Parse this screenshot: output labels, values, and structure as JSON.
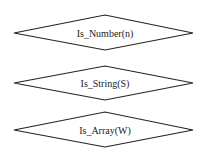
{
  "diagram": {
    "type": "flowchart-decisions",
    "stroke_color": "#222222",
    "background": "#ffffff",
    "nodes": [
      {
        "shape": "diamond",
        "label": "Is_Number(n)"
      },
      {
        "shape": "diamond",
        "label": "Is_String(S)"
      },
      {
        "shape": "diamond",
        "label": "Is_Array(W)"
      }
    ]
  }
}
